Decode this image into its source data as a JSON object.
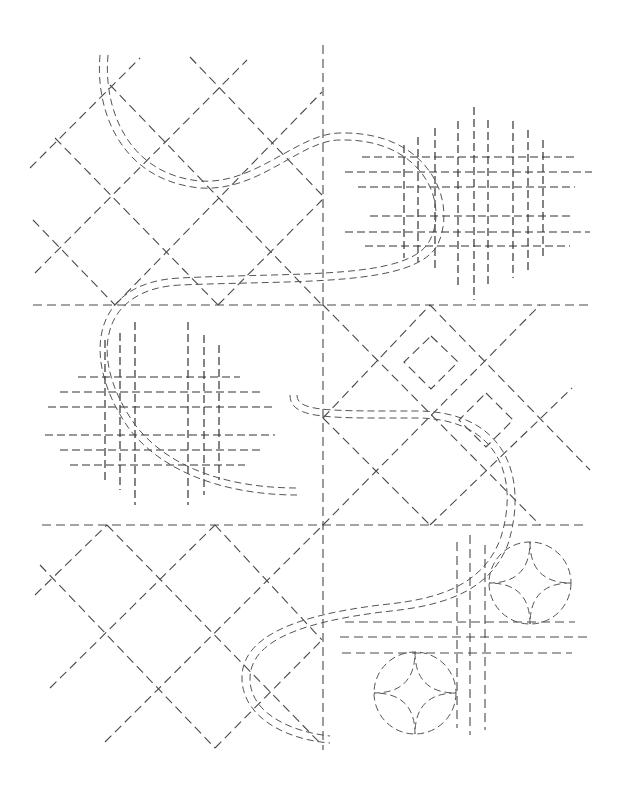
{
  "diagram": {
    "type": "sashiko-stitch-pattern",
    "background": "#ffffff",
    "stroke_color": "#4a4a4a",
    "dividers": {
      "vertical_x": 323,
      "vertical_y1": 45,
      "vertical_y2": 750,
      "horizontals": [
        {
          "x1": 33,
          "x2": 590,
          "y": 305
        },
        {
          "x1": 42,
          "x2": 583,
          "y": 525
        }
      ]
    },
    "panels": [
      {
        "name": "top-left",
        "motif": "diagonal-lattice"
      },
      {
        "name": "top-right",
        "motif": "crosshatch-grid"
      },
      {
        "name": "middle-left",
        "motif": "crosshatch-grid"
      },
      {
        "name": "middle-right",
        "motif": "diamond-lattice-with-inner-squares"
      },
      {
        "name": "bottom-left",
        "motif": "diagonal-lattice"
      },
      {
        "name": "bottom-right",
        "motif": "circles-with-four-petal-star-and-cross-lines"
      }
    ],
    "cords": [
      {
        "name": "upper-cord",
        "path": "M100 55 C 95 110, 120 180, 200 188 C 260 192, 300 140, 340 140 C 420 138, 450 200, 430 240 C 410 280, 300 272, 180 278 C 90 282, 80 360, 130 430 C 170 480, 240 495, 297 495"
      },
      {
        "name": "lower-cord",
        "path": "M290 395 C 290 420, 330 418, 420 418 C 500 420, 520 480, 500 540 C 480 590, 430 600, 380 605 C 300 615, 240 635, 242 680 C 244 720, 290 740, 330 743"
      }
    ],
    "rosettes": [
      {
        "cx": 530,
        "cy": 583,
        "r": 41
      },
      {
        "cx": 415,
        "cy": 693,
        "r": 41
      }
    ]
  }
}
